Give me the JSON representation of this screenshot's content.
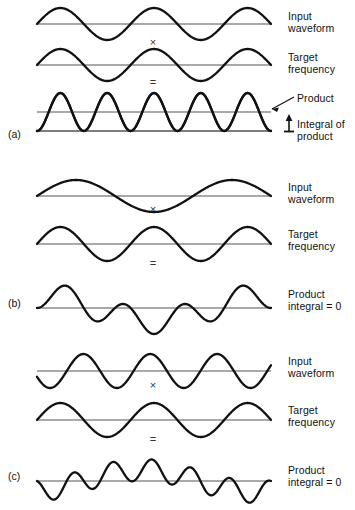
{
  "figure": {
    "background_color": "#ffffff",
    "wave_color": "#111111",
    "axis_color": "#555555"
  },
  "panels": [
    {
      "tag": "(a)",
      "rows": [
        {
          "role": "input",
          "label": "Input\nwaveform"
        },
        {
          "role": "target",
          "label": "Target\nfrequency"
        },
        {
          "role": "product",
          "label": "Product"
        }
      ],
      "operators": {
        "multiply": "×",
        "equals": "="
      },
      "annotations": [
        {
          "name": "product-pointer-label",
          "text": "Product"
        },
        {
          "name": "integral-label",
          "text": "Integral of\nproduct"
        }
      ]
    },
    {
      "tag": "(b)",
      "rows": [
        {
          "role": "input",
          "label": "Input\nwaveform"
        },
        {
          "role": "target",
          "label": "Target\nfrequency"
        },
        {
          "role": "product",
          "label": "Product\nintegral = 0"
        }
      ],
      "operators": {
        "multiply": "×",
        "equals": "="
      }
    },
    {
      "tag": "(c)",
      "rows": [
        {
          "role": "input",
          "label": "Input\nwaveform"
        },
        {
          "role": "target",
          "label": "Target\nfrequency"
        },
        {
          "role": "product",
          "label": "Product\nintegral = 0"
        }
      ],
      "operators": {
        "multiply": "×",
        "equals": "="
      }
    }
  ],
  "chart_data": {
    "type": "line",
    "xlabel": "",
    "ylabel": "",
    "grid": false,
    "legend_position": "right",
    "x_range": [
      0,
      1
    ],
    "plots": [
      {
        "panel": "(a)",
        "name": "a-input-waveform",
        "label": "Input waveform",
        "function": "sin",
        "cycles": 2.5,
        "amplitude": 1.0,
        "phase_deg": 0,
        "baseline": 0
      },
      {
        "panel": "(a)",
        "name": "a-target-frequency",
        "label": "Target frequency",
        "function": "sin",
        "cycles": 2.5,
        "amplitude": 1.0,
        "phase_deg": 0,
        "baseline": 0
      },
      {
        "panel": "(a)",
        "name": "a-product",
        "label": "Product",
        "function": "sin_squared",
        "cycles": 2.5,
        "amplitude": 1.0,
        "phase_deg": 0,
        "baseline": 0,
        "mean_level": 0.5,
        "integral_nonzero": true
      },
      {
        "panel": "(b)",
        "name": "b-input-waveform",
        "label": "Input waveform",
        "function": "sin",
        "cycles": 1.5,
        "amplitude": 1.0,
        "phase_deg": 0,
        "baseline": 0
      },
      {
        "panel": "(b)",
        "name": "b-target-frequency",
        "label": "Target frequency",
        "function": "sin",
        "cycles": 2.5,
        "amplitude": 1.0,
        "phase_deg": 0,
        "baseline": 0
      },
      {
        "panel": "(b)",
        "name": "b-product",
        "label": "Product integral = 0",
        "function": "product",
        "factor_cycles": [
          1.5,
          2.5
        ],
        "amplitude": 1.0,
        "baseline": 0,
        "integral_nonzero": false
      },
      {
        "panel": "(c)",
        "name": "c-input-waveform",
        "label": "Input waveform",
        "function": "sin",
        "cycles": 3.5,
        "amplitude": 1.0,
        "phase_deg": 200,
        "baseline": 0
      },
      {
        "panel": "(c)",
        "name": "c-target-frequency",
        "label": "Target frequency",
        "function": "sin",
        "cycles": 2.5,
        "amplitude": 1.0,
        "phase_deg": 0,
        "baseline": 0
      },
      {
        "panel": "(c)",
        "name": "c-product",
        "label": "Product integral = 0",
        "function": "product",
        "factor_cycles": [
          3.5,
          2.5
        ],
        "amplitude": 1.0,
        "baseline": 0,
        "integral_nonzero": false
      }
    ]
  }
}
